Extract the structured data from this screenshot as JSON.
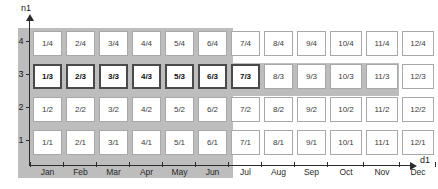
{
  "axes": {
    "y_label": "n1",
    "x_label": "d1",
    "y_ticks": [
      "4",
      "3",
      "2",
      "1"
    ],
    "x_ticks": [
      "Jan",
      "Feb",
      "Mar",
      "Apr",
      "May",
      "Jun",
      "Jul",
      "Aug",
      "Sep",
      "Oct",
      "Nov",
      "Dec"
    ]
  },
  "highlight": {
    "row": "3",
    "columns": [
      "Jan",
      "Feb",
      "Mar",
      "Apr",
      "May",
      "Jun",
      "Jul"
    ],
    "band_color": "#bdbdbd"
  },
  "grid": {
    "rows": [
      {
        "level": "4",
        "highlighted": false,
        "cells": [
          {
            "label": "1/4",
            "highlighted": false
          },
          {
            "label": "2/4",
            "highlighted": false
          },
          {
            "label": "3/4",
            "highlighted": false
          },
          {
            "label": "4/4",
            "highlighted": false
          },
          {
            "label": "5/4",
            "highlighted": false
          },
          {
            "label": "6/4",
            "highlighted": false
          },
          {
            "label": "7/4",
            "highlighted": false
          },
          {
            "label": "8/4",
            "highlighted": false
          },
          {
            "label": "9/4",
            "highlighted": false
          },
          {
            "label": "10/4",
            "highlighted": false
          },
          {
            "label": "11/4",
            "highlighted": false
          },
          {
            "label": "12/4",
            "highlighted": false
          }
        ]
      },
      {
        "level": "3",
        "highlighted": true,
        "cells": [
          {
            "label": "1/3",
            "highlighted": true
          },
          {
            "label": "2/3",
            "highlighted": true
          },
          {
            "label": "3/3",
            "highlighted": true
          },
          {
            "label": "4/3",
            "highlighted": true
          },
          {
            "label": "5/3",
            "highlighted": true
          },
          {
            "label": "6/3",
            "highlighted": true
          },
          {
            "label": "7/3",
            "highlighted": true
          },
          {
            "label": "8/3",
            "highlighted": false
          },
          {
            "label": "9/3",
            "highlighted": false
          },
          {
            "label": "10/3",
            "highlighted": false
          },
          {
            "label": "11/3",
            "highlighted": false
          },
          {
            "label": "12/3",
            "highlighted": false
          }
        ]
      },
      {
        "level": "2",
        "highlighted": false,
        "cells": [
          {
            "label": "1/2",
            "highlighted": false
          },
          {
            "label": "2/2",
            "highlighted": false
          },
          {
            "label": "3/2",
            "highlighted": false
          },
          {
            "label": "4/2",
            "highlighted": false
          },
          {
            "label": "5/2",
            "highlighted": false
          },
          {
            "label": "6/2",
            "highlighted": false
          },
          {
            "label": "7/2",
            "highlighted": false
          },
          {
            "label": "8/2",
            "highlighted": false
          },
          {
            "label": "9/2",
            "highlighted": false
          },
          {
            "label": "10/2",
            "highlighted": false
          },
          {
            "label": "11/2",
            "highlighted": false
          },
          {
            "label": "12/2",
            "highlighted": false
          }
        ]
      },
      {
        "level": "1",
        "highlighted": false,
        "cells": [
          {
            "label": "1/1",
            "highlighted": false
          },
          {
            "label": "2/1",
            "highlighted": false
          },
          {
            "label": "3/1",
            "highlighted": false
          },
          {
            "label": "4/1",
            "highlighted": false
          },
          {
            "label": "5/1",
            "highlighted": false
          },
          {
            "label": "6/1",
            "highlighted": false
          },
          {
            "label": "7/1",
            "highlighted": false
          },
          {
            "label": "8/1",
            "highlighted": false
          },
          {
            "label": "9/1",
            "highlighted": false
          },
          {
            "label": "10/1",
            "highlighted": false
          },
          {
            "label": "11/1",
            "highlighted": false
          },
          {
            "label": "12/1",
            "highlighted": false
          }
        ]
      }
    ]
  },
  "chart_data": {
    "type": "heatmap",
    "title": "",
    "xlabel": "d1",
    "ylabel": "n1",
    "x": [
      "Jan",
      "Feb",
      "Mar",
      "Apr",
      "May",
      "Jun",
      "Jul",
      "Aug",
      "Sep",
      "Oct",
      "Nov",
      "Dec"
    ],
    "y": [
      "4",
      "3",
      "2",
      "1"
    ],
    "cell_labels": [
      [
        "1/4",
        "2/4",
        "3/4",
        "4/4",
        "5/4",
        "6/4",
        "7/4",
        "8/4",
        "9/4",
        "10/4",
        "11/4",
        "12/4"
      ],
      [
        "1/3",
        "2/3",
        "3/3",
        "4/3",
        "5/3",
        "6/3",
        "7/3",
        "8/3",
        "9/3",
        "10/3",
        "11/3",
        "12/3"
      ],
      [
        "1/2",
        "2/2",
        "3/2",
        "4/2",
        "5/2",
        "6/2",
        "7/2",
        "8/2",
        "9/2",
        "10/2",
        "11/2",
        "12/2"
      ],
      [
        "1/1",
        "2/1",
        "3/1",
        "4/1",
        "5/1",
        "6/1",
        "7/1",
        "8/1",
        "9/1",
        "10/1",
        "11/1",
        "12/1"
      ]
    ],
    "highlighted_cells": [
      "1/3",
      "2/3",
      "3/3",
      "4/3",
      "5/3",
      "6/3",
      "7/3"
    ],
    "highlighted_row": "3",
    "highlighted_columns": [
      "Jan",
      "Feb",
      "Mar",
      "Apr",
      "May",
      "Jun",
      "Jul"
    ],
    "grid": true,
    "legend": "none"
  }
}
